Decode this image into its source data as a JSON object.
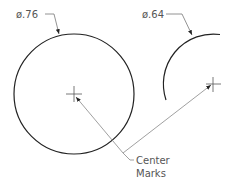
{
  "diagram": {
    "dimensions": [
      {
        "id": "left-circle",
        "label": "ø.76",
        "type": "circle"
      },
      {
        "id": "right-arc",
        "label": "ø.64",
        "type": "arc"
      }
    ],
    "callout": {
      "line1": "Center",
      "line2": "Marks"
    },
    "colors": {
      "geometry": "#222222",
      "leader": "#777777",
      "text": "#555555"
    }
  }
}
